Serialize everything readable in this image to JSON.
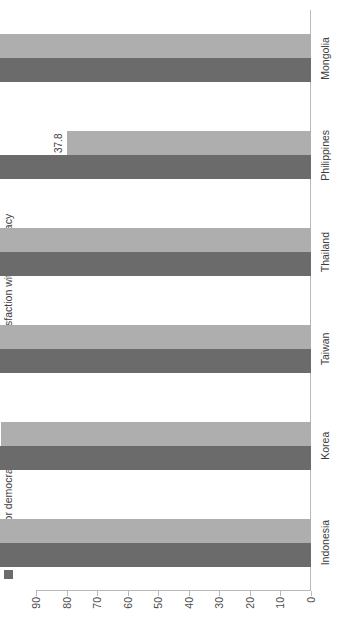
{
  "chart_data": {
    "type": "bar",
    "title": "",
    "subtitle": "",
    "orientation": "vertical-bars-rotated-90",
    "xlabel": "",
    "ylabel": "",
    "ylim": [
      0,
      90
    ],
    "yticks": [
      0,
      10,
      20,
      30,
      40,
      50,
      60,
      70,
      80,
      90
    ],
    "ytick_labels": [
      "0",
      "10",
      "20",
      "30",
      "40",
      "50",
      "60",
      "70",
      "80",
      "90"
    ],
    "grid": false,
    "legend_position": "top",
    "categories": [
      "Indonesia",
      "Korea",
      "Taiwan",
      "Thailand",
      "Philippines",
      "Mongolia"
    ],
    "series": [
      {
        "name": "Support for democracy",
        "color": "#6b6b6b",
        "values": [
          65.44,
          60.7,
          55.24,
          70.76,
          52.06,
          65.44
        ],
        "labels": [
          "65.44",
          "60.7",
          "55.24",
          "70.76",
          "52.06",
          "65.44"
        ]
      },
      {
        "name": "Satisfaction with democracy",
        "color": "#aeaeae",
        "values": [
          58.9,
          48.1,
          55.9,
          79.7,
          37.8,
          63.4
        ],
        "labels": [
          "58.9",
          "48.1",
          "55.9",
          "79.7",
          "37.8",
          "63.4"
        ]
      }
    ]
  },
  "colors": {
    "support": "#6b6b6b",
    "satisfaction": "#aeaeae",
    "axis": "#b9b9b9",
    "text": "#3d3d3d",
    "background": "#ffffff"
  },
  "legend": {
    "support_label": "Support for democracy",
    "satisfaction_label": "Satisfaction with democracy"
  }
}
